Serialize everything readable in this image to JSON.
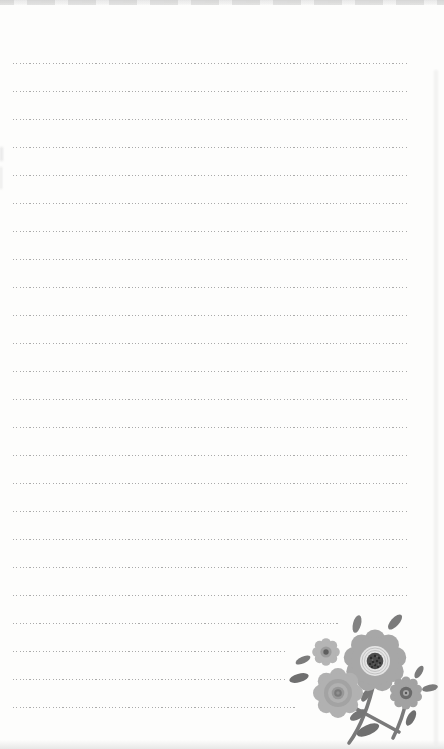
{
  "page": {
    "kind": "blank lined notepad page",
    "width": 444,
    "height": 749
  },
  "palette": {
    "paper": "#fdfdfc",
    "rule": "#8a8a8a",
    "edge-shadow": "#e9e9e9",
    "petal-light": "#b5b5b5",
    "petal-mid": "#a7a7a7",
    "petal-rose": "#b1b1b1",
    "rose-shade": "#a3a3a3",
    "rose-core": "#7a7a7a",
    "ring-bg": "#e4e4e4",
    "ring-line": "#c2c2c2",
    "seed-dark": "#4c4c4c",
    "seed-dot": "#2a2a2a",
    "leaf": "#7b7b7b",
    "leaf-dark": "#6f6f6f",
    "stem": "#7a7a7a",
    "center-dot": "#5e5e5e",
    "daisy-petal": "#a2a2a2",
    "daisy-core": "#6a6a6a",
    "daisy-core-mid": "#a8a8a8"
  },
  "ruled_lines": {
    "count": 24,
    "first_y": 63,
    "spacing": 28,
    "left_x": 13,
    "default_right_x": 409,
    "short_lines": [
      {
        "index": 20,
        "right_x": 340
      },
      {
        "index": 21,
        "right_x": 286
      },
      {
        "index": 22,
        "right_x": 286
      },
      {
        "index": 23,
        "right_x": 297
      }
    ]
  },
  "decoration": {
    "name": "gray flower bouquet",
    "position": "bottom-right",
    "parts": [
      "small-flower",
      "large-scalloped-flower",
      "rose-flower",
      "daisy-flower",
      "leaves",
      "stems"
    ]
  }
}
